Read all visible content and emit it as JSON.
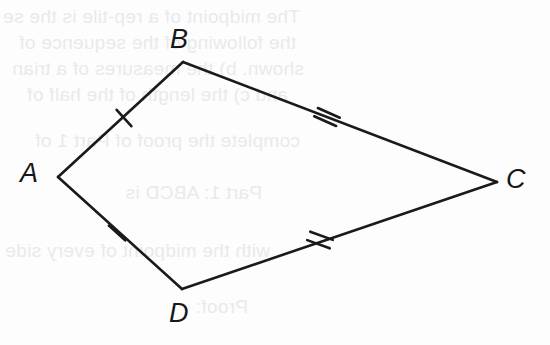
{
  "figure": {
    "name": "quadrilateral-abcd",
    "canvas": {
      "width": 550,
      "height": 345
    },
    "background_color": "#fdfdfd",
    "stroke_color": "#1a1a1a",
    "stroke_width": 2.6,
    "label_color": "#171717"
  },
  "vertices": [
    {
      "id": "A",
      "label": "A",
      "x": 58,
      "y": 177,
      "label_x": 20,
      "label_y": 160
    },
    {
      "id": "B",
      "label": "B",
      "x": 183,
      "y": 62,
      "label_x": 170,
      "label_y": 26
    },
    {
      "id": "C",
      "label": "C",
      "x": 497,
      "y": 182,
      "label_x": 506,
      "label_y": 166
    },
    {
      "id": "D",
      "label": "D",
      "x": 182,
      "y": 289,
      "label_x": 169,
      "label_y": 300
    }
  ],
  "sides": [
    {
      "id": "AB",
      "from": "A",
      "to": "B",
      "ticks": 1,
      "x1": 58,
      "y1": 177,
      "x2": 183,
      "y2": 62
    },
    {
      "id": "BC",
      "from": "B",
      "to": "C",
      "ticks": 2,
      "x1": 183,
      "y1": 62,
      "x2": 497,
      "y2": 182
    },
    {
      "id": "CD",
      "from": "C",
      "to": "D",
      "ticks": 2,
      "x1": 497,
      "y1": 182,
      "x2": 182,
      "y2": 289
    },
    {
      "id": "DA",
      "from": "D",
      "to": "A",
      "ticks": 1,
      "x1": 182,
      "y1": 289,
      "x2": 58,
      "y2": 177
    }
  ],
  "tick_marks": [
    {
      "id": "tick-ab",
      "side": "AB",
      "count": 1,
      "cx": 124,
      "cy": 118,
      "angle": -42,
      "length": 22
    },
    {
      "id": "tick-bc",
      "side": "BC",
      "count": 2,
      "cx": 327,
      "cy": 117,
      "angle": -66,
      "length": 24,
      "spacing": 9
    },
    {
      "id": "tick-cd",
      "side": "CD",
      "count": 2,
      "cx": 320,
      "cy": 240,
      "angle": -70,
      "length": 24,
      "spacing": 9
    },
    {
      "id": "tick-da",
      "side": "DA",
      "count": 1,
      "cx": 117,
      "cy": 233,
      "angle": -48,
      "length": 22
    }
  ],
  "background_text": {
    "note": "faint mirrored bleed-through text from reverse side of page",
    "color": "#e9e9ec",
    "lines": [
      {
        "text": "The midpoint of a rep-tile is the se",
        "x": 300,
        "y": 6
      },
      {
        "text": "the following of the sequence of",
        "x": 296,
        "y": 32
      },
      {
        "text": "shown.  b) the measures of a trian",
        "x": 304,
        "y": 58
      },
      {
        "text": "and c) the length of the half of",
        "x": 288,
        "y": 84
      },
      {
        "text": "complete the proof of Part 1 of",
        "x": 300,
        "y": 130
      },
      {
        "text": "Part 1:  ABCD is",
        "x": 262,
        "y": 182
      },
      {
        "text": "with the midpoint of every side more",
        "x": 270,
        "y": 240
      },
      {
        "text": "Proof:",
        "x": 248,
        "y": 296
      }
    ]
  }
}
